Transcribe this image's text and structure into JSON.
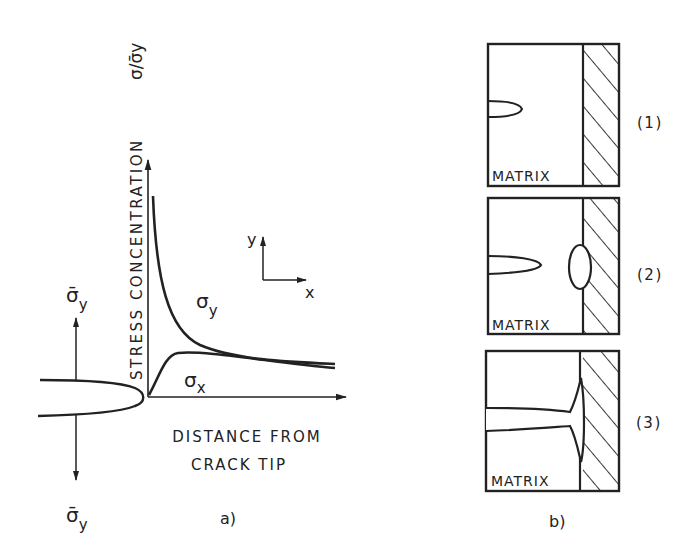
{
  "panel_a": {
    "caption": "a)",
    "y_axis_label": "STRESS  CONCENTRATION",
    "y_axis_symbol": "σ/σ̄y",
    "x_axis_label_line1": "DISTANCE FROM",
    "x_axis_label_line2": "CRACK TIP",
    "curve_sigma_y": "σ",
    "curve_sigma_y_sub": "y",
    "curve_sigma_x": "σ",
    "curve_sigma_x_sub": "x",
    "coord_y": "y",
    "coord_x": "x",
    "applied_top": "σ̄",
    "applied_top_sub": "y",
    "applied_bottom": "σ̄",
    "applied_bottom_sub": "y"
  },
  "panel_b": {
    "caption": "b)",
    "boxes": [
      {
        "label": "MATRIX",
        "stage": "(1)"
      },
      {
        "label": "MATRIX",
        "stage": "(2)"
      },
      {
        "label": "MATRIX",
        "stage": "(3)"
      }
    ]
  },
  "colors": {
    "ink": "#222222",
    "background": "#ffffff"
  }
}
